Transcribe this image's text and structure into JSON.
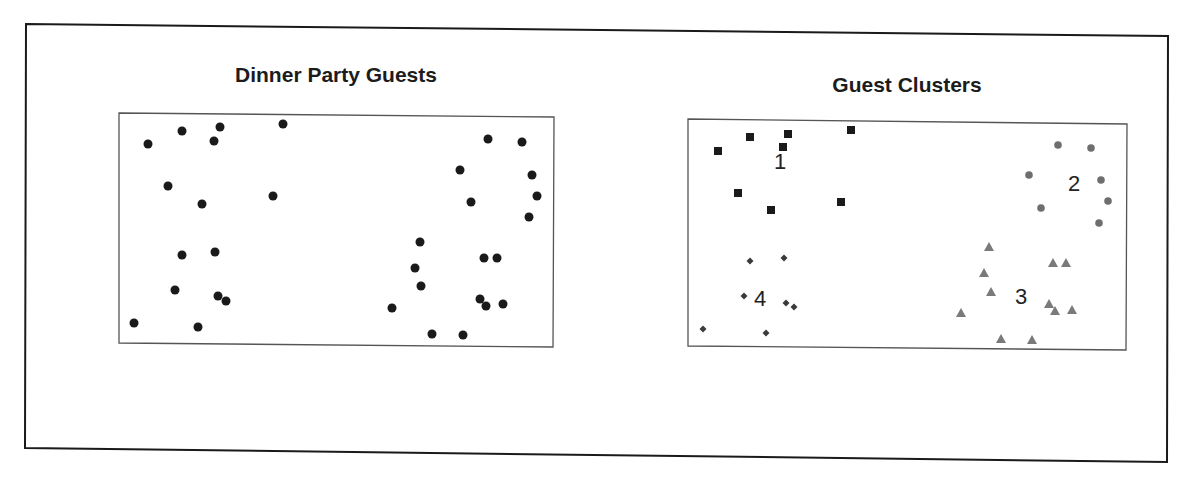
{
  "chart_data": [
    {
      "type": "scatter",
      "title": "Dinner Party Guests",
      "xlabel": "",
      "ylabel": "",
      "grid": false,
      "legend": null,
      "axes_visible": false,
      "plot_box": {
        "x": 120,
        "y": 115,
        "width": 433,
        "height": 230
      },
      "marker": {
        "shape": "circle",
        "color": "#1a1a1a",
        "radius": 4.5
      },
      "points": [
        [
          148,
          144
        ],
        [
          182,
          131
        ],
        [
          220,
          127
        ],
        [
          214,
          141
        ],
        [
          283,
          124
        ],
        [
          168,
          186
        ],
        [
          202,
          204
        ],
        [
          273,
          196
        ],
        [
          182,
          255
        ],
        [
          215,
          252
        ],
        [
          175,
          290
        ],
        [
          218,
          296
        ],
        [
          226,
          301
        ],
        [
          134,
          323
        ],
        [
          198,
          327
        ],
        [
          488,
          139
        ],
        [
          522,
          142
        ],
        [
          460,
          170
        ],
        [
          532,
          175
        ],
        [
          537,
          196
        ],
        [
          471,
          202
        ],
        [
          529,
          217
        ],
        [
          420,
          242
        ],
        [
          484,
          258
        ],
        [
          497,
          258
        ],
        [
          415,
          268
        ],
        [
          421,
          286
        ],
        [
          480,
          299
        ],
        [
          486,
          306
        ],
        [
          503,
          304
        ],
        [
          392,
          308
        ],
        [
          432,
          334
        ],
        [
          463,
          335
        ]
      ]
    },
    {
      "type": "scatter",
      "title": "Guest Clusters",
      "xlabel": "",
      "ylabel": "",
      "grid": false,
      "axes_visible": false,
      "plot_box": {
        "x": 688,
        "y": 121,
        "width": 439,
        "height": 227
      },
      "series": [
        {
          "name": "1",
          "marker": "square",
          "color": "#1a1a1a",
          "label_pos": [
            780,
            163
          ],
          "points": [
            [
              718,
              151
            ],
            [
              750,
              137
            ],
            [
              788,
              134
            ],
            [
              783,
              147
            ],
            [
              851,
              130
            ],
            [
              738,
              193
            ],
            [
              771,
              210
            ],
            [
              841,
              202
            ]
          ]
        },
        {
          "name": "2",
          "marker": "circle",
          "color": "#6e6e6e",
          "label_pos": [
            1074,
            185
          ],
          "points": [
            [
              1058,
              145
            ],
            [
              1091,
              148
            ],
            [
              1029,
              175
            ],
            [
              1101,
              180
            ],
            [
              1108,
              201
            ],
            [
              1041,
              208
            ],
            [
              1099,
              223
            ]
          ]
        },
        {
          "name": "3",
          "marker": "triangle",
          "color": "#7a7a7a",
          "label_pos": [
            1021,
            298
          ],
          "points": [
            [
              989,
              247
            ],
            [
              1053,
              263
            ],
            [
              1066,
              263
            ],
            [
              984,
              273
            ],
            [
              991,
              292
            ],
            [
              1049,
              304
            ],
            [
              1055,
              311
            ],
            [
              1072,
              310
            ],
            [
              961,
              313
            ],
            [
              1001,
              339
            ],
            [
              1032,
              340
            ]
          ]
        },
        {
          "name": "4",
          "marker": "diamond",
          "color": "#3a3a3a",
          "label_pos": [
            760,
            300
          ],
          "points": [
            [
              750,
              261
            ],
            [
              784,
              258
            ],
            [
              744,
              296
            ],
            [
              786,
              303
            ],
            [
              794,
              307
            ],
            [
              703,
              329
            ],
            [
              766,
              333
            ]
          ]
        }
      ]
    }
  ],
  "figure": {
    "left_title": "Dinner Party Guests",
    "right_title": "Guest Clusters",
    "cluster_labels": [
      "1",
      "2",
      "3",
      "4"
    ]
  }
}
